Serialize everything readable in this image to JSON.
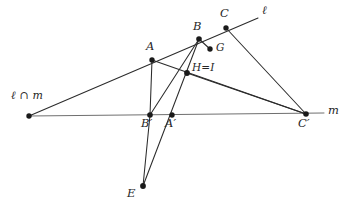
{
  "figure": {
    "type": "geometry-diagram",
    "background_color": "#ffffff",
    "line_color": "#2b2b2b",
    "point_color": "#1a1a1a",
    "line_m_color": "#6f6f6f"
  },
  "labels": {
    "intersection": "ℓ ∩ m",
    "line_l": "ℓ",
    "line_m": "m",
    "A": "A",
    "B": "B",
    "C": "C",
    "G": "G",
    "HI": "H=I",
    "A_prime": "A′",
    "B_prime": "B′",
    "C_prime": "C′",
    "E": "E"
  },
  "points": {
    "O": {
      "name": "l-intersect-m",
      "x": 29,
      "y": 116,
      "label": "ℓ ∩ m",
      "label_x": 11,
      "label_y": 90
    },
    "A": {
      "name": "A",
      "x": 152,
      "y": 60,
      "label": "A",
      "label_x": 146,
      "label_y": 42
    },
    "B": {
      "name": "B",
      "x": 199,
      "y": 39,
      "label": "B",
      "label_x": 193,
      "label_y": 22
    },
    "C": {
      "name": "C",
      "x": 226,
      "y": 28,
      "label": "C",
      "label_x": 220,
      "label_y": 10
    },
    "G": {
      "name": "G",
      "x": 209,
      "y": 48,
      "label": "G",
      "label_x": 215,
      "label_y": 42
    },
    "HI": {
      "name": "H-equals-I",
      "x": 187,
      "y": 73,
      "label": "H=I",
      "label_x": 192,
      "label_y": 62
    },
    "Bp": {
      "name": "B-prime",
      "x": 150,
      "y": 115,
      "label": "B′",
      "label_x": 142,
      "label_y": 119
    },
    "Ap": {
      "name": "A-prime",
      "x": 172,
      "y": 115,
      "label": "A′",
      "label_x": 166,
      "label_y": 119
    },
    "Cp": {
      "name": "C-prime",
      "x": 306,
      "y": 114,
      "label": "C′",
      "label_x": 298,
      "label_y": 118
    },
    "E": {
      "name": "E",
      "x": 143,
      "y": 186,
      "label": "E",
      "label_x": 127,
      "label_y": 188
    }
  },
  "line_endpoints": {
    "line_l_start": {
      "x": 29,
      "y": 116
    },
    "line_l_end": {
      "x": 258,
      "y": 18
    },
    "line_m_start": {
      "x": 29,
      "y": 116
    },
    "line_m_end": {
      "x": 324,
      "y": 113
    },
    "line_l_label": {
      "x": 262,
      "y": 6
    },
    "line_m_label": {
      "x": 328,
      "y": 105
    }
  },
  "segments": [
    {
      "name": "line-l",
      "from": "line_l_start",
      "to": "line_l_end",
      "style": "l"
    },
    {
      "name": "line-m",
      "from": "line_m_start",
      "to": "line_m_end",
      "style": "m"
    },
    {
      "name": "segment-A-Bprime",
      "from": "A",
      "to": "Bp"
    },
    {
      "name": "segment-A-Cprime",
      "from": "A",
      "to": "Cp"
    },
    {
      "name": "segment-B-Bprime",
      "from": "B",
      "to": "Bp"
    },
    {
      "name": "segment-B-E",
      "from": "B",
      "to": "E"
    },
    {
      "name": "segment-Bprime-E",
      "from": "Bp",
      "to": "E"
    },
    {
      "name": "segment-C-Cprime",
      "from": "C",
      "to": "Cp"
    },
    {
      "name": "segment-HI-Cprime",
      "from": "HI",
      "to": "Cp"
    },
    {
      "name": "segment-B-G",
      "from": "B",
      "to": "G"
    }
  ]
}
